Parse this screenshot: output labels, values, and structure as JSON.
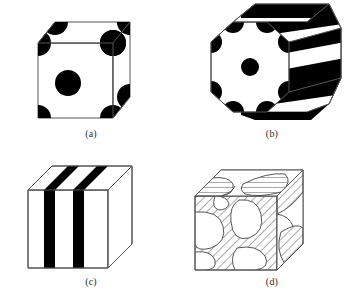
{
  "figure": {
    "title": "",
    "background_color": "#ffffff",
    "line_color": "#4a4a4a",
    "fill_dark": "#000000",
    "fill_light": "#ffffff",
    "hatch_color": "#555555"
  },
  "panels": [
    {
      "id": "a",
      "caption": "(a)",
      "shape": "cube",
      "morphology": "spherical dispersion",
      "feature_color": "#000000",
      "features": {
        "corner_spheres": 8,
        "face_center_spheres": 2,
        "sphere_radius_px": 13
      }
    },
    {
      "id": "b",
      "caption": "(b)",
      "shape": "hexagonal-prism",
      "morphology": "cylindrical / banded",
      "feature_color": "#000000",
      "features": {
        "bands": 3,
        "vertex_wedges": 6,
        "center_sphere_radius_px": 9
      }
    },
    {
      "id": "c",
      "caption": "(c)",
      "shape": "cube",
      "morphology": "lamellar",
      "feature_color": "#000000",
      "features": {
        "lamellae": 2,
        "lamella_width_px": 11
      }
    },
    {
      "id": "d",
      "caption": "(d)",
      "shape": "cube",
      "morphology": "bicontinuous interpenetrating network",
      "feature_color": "#555555",
      "features": {
        "hatched_regions": 1,
        "hatch_angle_deg": 45
      }
    }
  ]
}
